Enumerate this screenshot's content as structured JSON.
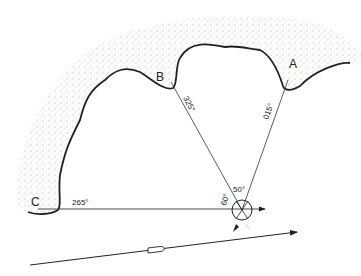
{
  "diagram": {
    "type": "three-point bearing fix",
    "points": {
      "A": {
        "label": "A",
        "bearing": "015°"
      },
      "B": {
        "label": "B",
        "bearing": "325°"
      },
      "C": {
        "label": "C",
        "bearing": "265°"
      }
    },
    "angles": {
      "between_A_B": "50°",
      "between_B_C": "60°"
    },
    "colors": {
      "ink": "#222222",
      "land": "#bdbdbd",
      "paper": "#ffffff"
    }
  }
}
